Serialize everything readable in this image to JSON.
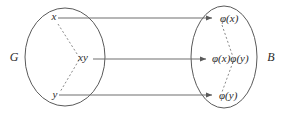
{
  "figure": {
    "type": "group-homomorphism-diagram",
    "domain_set": {
      "label": "G"
    },
    "codomain_set": {
      "label": "B"
    },
    "domain_elements": [
      {
        "id": "x",
        "label": "x"
      },
      {
        "id": "xy",
        "label": "xy"
      },
      {
        "id": "y",
        "label": "y"
      }
    ],
    "codomain_elements": [
      {
        "id": "phi-x",
        "label": "φ(x)"
      },
      {
        "id": "phi-x-phi-y",
        "label": "φ(x)φ(y)"
      },
      {
        "id": "phi-y",
        "label": "φ(y)"
      }
    ],
    "mappings": [
      {
        "from": "x",
        "to": "phi-x"
      },
      {
        "from": "xy",
        "to": "phi-x-phi-y"
      },
      {
        "from": "y",
        "to": "phi-y"
      }
    ],
    "colors": {
      "background": "#ffffff",
      "ellipse_stroke": "#5a5a5a",
      "arrow_stroke": "#6e6e6e",
      "dashed_stroke": "#8a8a8a",
      "text": "#2b2b2b"
    }
  }
}
